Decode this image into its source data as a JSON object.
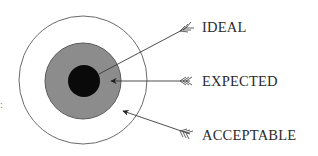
{
  "diagram": {
    "type": "concentric-target",
    "rings": [
      {
        "name": "acceptable",
        "label": "ACCEPTABLE",
        "fill": "#ffffff",
        "stroke": "#6a6a6a",
        "cx": 83,
        "cy": 80,
        "r": 64
      },
      {
        "name": "expected",
        "label": "EXPECTED",
        "fill": "#8c8c8c",
        "stroke": "#5a5a5a",
        "cx": 83,
        "cy": 81,
        "r": 38
      },
      {
        "name": "ideal",
        "label": "IDEAL",
        "fill": "#0a0a0a",
        "stroke": "#000000",
        "cx": 84,
        "cy": 81,
        "r": 16
      }
    ],
    "labels": {
      "ideal": "IDEAL",
      "expected": "EXPECTED",
      "acceptable": "ACCEPTABLE"
    },
    "edge_mark": ":",
    "colors": {
      "line": "#3a3a3a",
      "text": "#2a2a2a"
    }
  }
}
